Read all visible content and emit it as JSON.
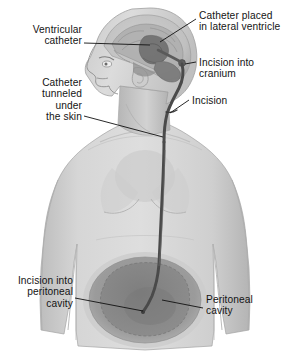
{
  "figure": {
    "view": "anterior/lateral view of head, neck, thorax and abdomen with cutaway"
  },
  "labels": {
    "ventricular_catheter": "Ventricular\ncatheter",
    "catheter_placed": "Catheter placed\nin lateral ventricle",
    "incision_cranium": "Incision into\ncranium",
    "catheter_tunneled": "Catheter\ntunneled\nunder\nthe skin",
    "incision_neck": "Incision",
    "incision_peritoneal": "Incision into\nperitoneal\ncavity",
    "peritoneal_cavity": "Peritoneal\ncavity"
  },
  "anatomy": {
    "head": "head-profile",
    "brain": "brain-cutaway",
    "lateral_ventricle": "lateral-ventricle",
    "torso": "torso-shoulders-chest",
    "abdomen": "abdomen",
    "peritoneal_cavity": "peritoneal-cavity-oval",
    "catheter_tube": "shunt-catheter-tube"
  },
  "colors": {
    "skin_light": "#d8d8d8",
    "skin_mid": "#c4c4c4",
    "skin_shadow": "#a8a8a8",
    "brain_mid": "#9a9a9a",
    "brain_dark": "#6f6f6f",
    "cavity_ring": "#9d9d9d",
    "cavity_inner": "#8a8a8a",
    "catheter": "#4a4a4a",
    "outline": "#8e8e8e",
    "text": "#141414",
    "leader": "#111111",
    "background": "#ffffff"
  }
}
